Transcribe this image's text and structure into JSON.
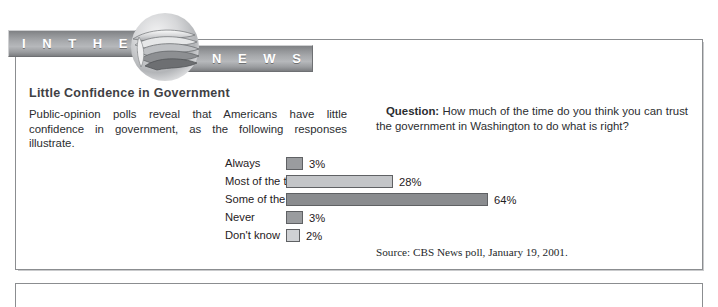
{
  "banner": {
    "left_text": "I N  T H E",
    "right_text": "N E W S",
    "graphic_name": "newspaper-roll-graphic"
  },
  "article": {
    "title": "Little Confidence in Government",
    "body": "Public-opinion polls reveal that Americans have little confidence in government, as the following responses illustrate.",
    "question_label": "Question:",
    "question_text": " How much of the time do you think you can trust the government in Washington to do what is right?"
  },
  "chart_data": {
    "type": "bar",
    "title": "Little Confidence in Government",
    "xlabel": "",
    "ylabel": "",
    "orientation": "horizontal",
    "grid": false,
    "legend": "none",
    "xlim": [
      0,
      70
    ],
    "categories": [
      "Always",
      "Most of the time",
      "Some of the time",
      "Never",
      "Don't know"
    ],
    "values": [
      3,
      28,
      64,
      3,
      2
    ],
    "value_labels": [
      "3%",
      "28%",
      "64%",
      "3%",
      "2%"
    ],
    "bar_colors": [
      "#9a9c9f",
      "#c3c5c8",
      "#8a8c8f",
      "#9a9c9f",
      "#cfd1d4"
    ],
    "bar_pixel_widths": [
      17,
      107,
      202,
      17,
      14
    ],
    "source": "Source: CBS News poll, January 19, 2001."
  },
  "colors": {
    "panel_border": "#8b8d90",
    "banner_gray": "#a7a9ac",
    "banner_text": "#ffffff",
    "title_gray": "#3f4144"
  }
}
